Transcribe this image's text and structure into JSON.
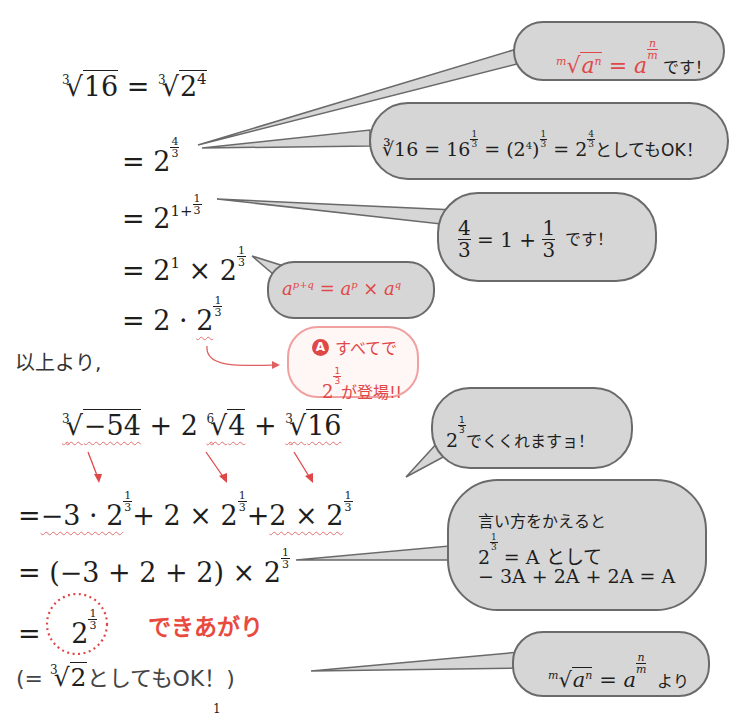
{
  "derivation": {
    "line1_lhs_index": "3",
    "line1_lhs_radicand": "16",
    "line1_rhs_index": "3",
    "line1_rhs_base": "2",
    "line1_rhs_exp": "4",
    "line2_base": "2",
    "line2_exp_num": "4",
    "line2_exp_den": "3",
    "line3_base": "2",
    "line3_exp_int": "1+",
    "line3_exp_num": "1",
    "line3_exp_den": "3",
    "line4_a": "2",
    "line4_a_exp": "1",
    "line4_op": "×",
    "line4_b": "2",
    "line4_b_num": "1",
    "line4_b_den": "3",
    "line5_a": "2",
    "line5_op": "·",
    "line5_b": "2",
    "line5_b_num": "1",
    "line5_b_den": "3",
    "equals": "="
  },
  "therefore_label": "以上より,",
  "problem": {
    "t1_index": "3",
    "t1_radicand": "−54",
    "plus": "+",
    "t2_coef": "2",
    "t2_index": "6",
    "t2_radicand": "4",
    "t3_index": "3",
    "t3_radicand": "16"
  },
  "step1": {
    "eq": "=",
    "t1": "−3 · 2",
    "t2": "2 × 2",
    "t3": "2 × 2",
    "num": "1",
    "den": "3",
    "plus": "+"
  },
  "step2": {
    "text": "= (−3 + 2 + 2) × 2",
    "num": "1",
    "den": "3"
  },
  "step3": {
    "eq": "=",
    "base": "2",
    "num": "1",
    "den": "3",
    "done_label": "できあがり"
  },
  "step4": {
    "open": "(= ",
    "index": "3",
    "radicand": "2",
    "tail": "としてもOK！)"
  },
  "bubbles": {
    "b1": {
      "formula_index": "m",
      "formula_base": "a",
      "formula_exp": "n",
      "eq": " = a",
      "exp_num": "n",
      "exp_den": "m",
      "tail": " です！"
    },
    "b2": {
      "text_a": "∛16 = 16",
      "exp1": "1",
      "exp1d": "3",
      "text_b": " = (2",
      "sup4": "4",
      "text_c": ")",
      "text_d": " = 2",
      "exp3n": "4",
      "exp3d": "3",
      "tail": "としてもOK！"
    },
    "b3": {
      "f1n": "4",
      "f1d": "3",
      "mid": " = 1 + ",
      "f2n": "1",
      "f2d": "3",
      "tail": "  です！"
    },
    "b4": {
      "text": "a",
      "p1": "p+q",
      "mid": " = a",
      "p2": "p",
      "times": " × a",
      "p3": "q"
    },
    "b5": {
      "badge": "A",
      "line1": "すべてで",
      "base": "2",
      "num": "1",
      "den": "3",
      "line2": "が登場!!"
    },
    "b6": {
      "base": "2",
      "num": "1",
      "den": "3",
      "tail": "でくくれますョ！"
    },
    "b7": {
      "line1": "言い方をかえると",
      "base": "2",
      "num": "1",
      "den": "3",
      "line2_tail": " = A として",
      "line3": "− 3A + 2A + 2A = A"
    },
    "b8": {
      "formula_index": "m",
      "formula_base": "a",
      "formula_exp": "n",
      "eq": " = a",
      "exp_num": "n",
      "exp_den": "m",
      "tail": "  より"
    }
  },
  "footer_fragment": "1",
  "colors": {
    "accent_red": "#e04848",
    "bubble_fill": "#d6d6d6",
    "bubble_stroke": "#6a6a6a",
    "pink_stroke": "#f0a0a0"
  }
}
